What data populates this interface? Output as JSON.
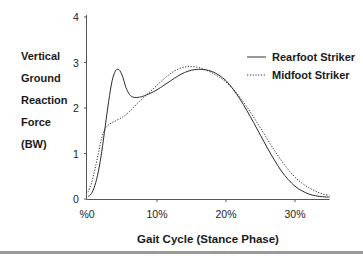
{
  "chart_data": {
    "type": "line",
    "title": "",
    "xlabel": "Gait Cycle (Stance Phase)",
    "ylabel_lines": [
      "Vertical",
      "Ground",
      "Reaction",
      "Force",
      "(BW)"
    ],
    "ylabel": "Vertical Ground Reaction Force (BW)",
    "xlim": [
      0,
      35
    ],
    "ylim": [
      0,
      4
    ],
    "grid": false,
    "x_ticks": [
      0,
      10,
      20,
      30
    ],
    "x_tick_labels": [
      "%0",
      "10%",
      "20%",
      "30%"
    ],
    "y_ticks": [
      0,
      1,
      2,
      3,
      4
    ],
    "y_tick_labels": [
      "0",
      "1",
      "2",
      "3",
      "4"
    ],
    "legend_position": "right",
    "series": [
      {
        "name": "Rearfoot Striker",
        "style": "solid",
        "x": [
          0,
          0.5,
          1,
          1.5,
          2,
          2.5,
          3,
          3.5,
          4,
          4.5,
          5,
          5.5,
          6,
          6.5,
          7,
          7.5,
          8,
          9,
          10,
          11,
          12,
          13,
          14,
          15,
          16,
          17,
          18,
          19,
          20,
          21,
          22,
          23,
          24,
          25,
          26,
          27,
          28,
          29,
          30,
          31,
          32,
          33,
          34,
          35
        ],
        "values": [
          0.05,
          0.12,
          0.3,
          0.6,
          1.05,
          1.6,
          2.15,
          2.6,
          2.82,
          2.84,
          2.7,
          2.45,
          2.3,
          2.24,
          2.23,
          2.24,
          2.26,
          2.32,
          2.4,
          2.5,
          2.6,
          2.7,
          2.78,
          2.83,
          2.85,
          2.84,
          2.8,
          2.72,
          2.6,
          2.42,
          2.2,
          1.95,
          1.68,
          1.4,
          1.12,
          0.86,
          0.62,
          0.43,
          0.28,
          0.18,
          0.11,
          0.07,
          0.05,
          0.04
        ]
      },
      {
        "name": "Midfoot Striker",
        "style": "dotted",
        "x": [
          0,
          0.5,
          1,
          1.5,
          2,
          2.5,
          3,
          3.5,
          4,
          5,
          6,
          7,
          8,
          9,
          10,
          11,
          12,
          13,
          14,
          15,
          16,
          17,
          18,
          19,
          20,
          21,
          22,
          23,
          24,
          25,
          26,
          27,
          28,
          29,
          30,
          31,
          32,
          33,
          34,
          35
        ],
        "values": [
          0.15,
          0.35,
          0.65,
          1.0,
          1.35,
          1.55,
          1.63,
          1.68,
          1.72,
          1.8,
          1.92,
          2.08,
          2.22,
          2.36,
          2.5,
          2.64,
          2.76,
          2.85,
          2.9,
          2.91,
          2.89,
          2.84,
          2.77,
          2.68,
          2.57,
          2.42,
          2.24,
          2.03,
          1.8,
          1.56,
          1.31,
          1.07,
          0.85,
          0.65,
          0.48,
          0.35,
          0.25,
          0.17,
          0.11,
          0.08
        ]
      }
    ]
  }
}
